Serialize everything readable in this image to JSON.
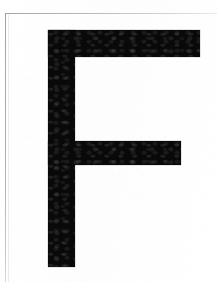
{
  "page": {
    "kind": "scanned-letter-specimen",
    "background_color": "#fefefe",
    "width": 217,
    "height": 282,
    "caption": ""
  },
  "frame": {
    "name": "scanned-border-rules",
    "line_color": "#9a9a9a",
    "ghost_line_color": "#cdcdcd",
    "top_rule_y": 13,
    "left_rule_x": 5
  },
  "glyph": {
    "character": "F",
    "name": "letter-f",
    "ink_color": "#090909",
    "style": "grotesque-sans-serif-bold",
    "case": "uppercase",
    "metrics": {
      "left": 48,
      "top": 30,
      "stem_width": 27,
      "stem_height": 237,
      "top_arm_width": 152,
      "top_arm_height": 27,
      "middle_arm_width": 133,
      "middle_arm_height": 24,
      "middle_arm_offset_y": 111
    }
  }
}
